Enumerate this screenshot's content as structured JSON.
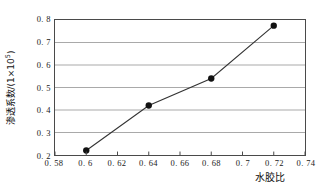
{
  "chart_data": {
    "type": "line",
    "title": "",
    "xlabel": "水胶比",
    "ylabel_text": "渗透系数/(1×10",
    "ylabel_exponent": "5",
    "ylabel_tail": ")",
    "ylabel_full": "渗透系数/(1×10⁵)",
    "x": [
      0.6,
      0.64,
      0.68,
      0.72
    ],
    "values": [
      0.22,
      0.42,
      0.54,
      0.775
    ],
    "series": [
      {
        "name": "渗透系数",
        "x": [
          0.6,
          0.64,
          0.68,
          0.72
        ],
        "values": [
          0.22,
          0.42,
          0.54,
          0.775
        ]
      }
    ],
    "xlim": [
      0.58,
      0.74
    ],
    "ylim": [
      0.2,
      0.8
    ],
    "xticks": [
      0.58,
      0.6,
      0.62,
      0.64,
      0.66,
      0.68,
      0.7,
      0.72,
      0.74
    ],
    "xtick_labels": [
      "0. 58",
      "0. 6",
      "0. 62",
      "0. 64",
      "0. 66",
      "0. 68",
      "0. 7",
      "0. 72",
      "0. 74"
    ],
    "yticks": [
      0.2,
      0.3,
      0.4,
      0.5,
      0.6,
      0.7,
      0.8
    ],
    "ytick_labels": [
      "0. 2",
      "0. 3",
      "0. 4",
      "0. 5",
      "0. 6",
      "0. 7",
      "0. 8"
    ],
    "grid": "horizontal",
    "legend": "none",
    "marker": "filled-circle",
    "marker_color": "#111111",
    "line_color": "#333333",
    "grid_color": "#a8a8a8",
    "frame_color": "#4a4a4a",
    "background": "#ffffff"
  }
}
